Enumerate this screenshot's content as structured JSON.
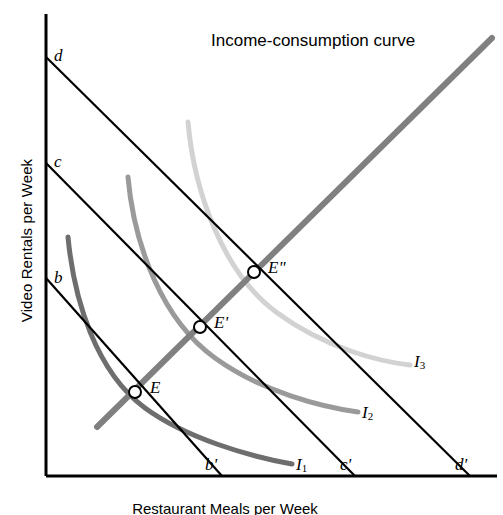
{
  "figure": {
    "title": "Income-consumption curve",
    "axis_y_label": "Video Rentals per Week",
    "axis_x_label": "Restaurant Meals per Week",
    "colors": {
      "axis": "#000000",
      "budget_line": "#000000",
      "icc": "#808080",
      "i1": "#6e6e6e",
      "i2": "#9a9a9a",
      "i3": "#d2d2d2",
      "marker_fill": "#ffffff"
    }
  },
  "axes": {
    "origin": {
      "x": 46,
      "y": 476
    },
    "y_top": {
      "x": 46,
      "y": 14
    },
    "x_right": {
      "x": 497,
      "y": 476
    }
  },
  "budget_lines": [
    {
      "name": "bb'",
      "y_label": "b",
      "x_label": "b'",
      "y_intercept": {
        "x": 46,
        "y": 278
      },
      "x_intercept": {
        "x": 222,
        "y": 476
      },
      "y_label_pos": {
        "x": 54,
        "y": 268
      },
      "x_label_pos": {
        "x": 205,
        "y": 455
      }
    },
    {
      "name": "cc'",
      "y_label": "c",
      "x_label": "c'",
      "y_intercept": {
        "x": 46,
        "y": 163
      },
      "x_intercept": {
        "x": 355,
        "y": 476
      },
      "y_label_pos": {
        "x": 54,
        "y": 152
      },
      "x_label_pos": {
        "x": 340,
        "y": 455
      }
    },
    {
      "name": "dd'",
      "y_label": "d",
      "x_label": "d'",
      "y_intercept": {
        "x": 46,
        "y": 57
      },
      "x_intercept": {
        "x": 470,
        "y": 476
      },
      "y_label_pos": {
        "x": 54,
        "y": 46
      },
      "x_label_pos": {
        "x": 455,
        "y": 455
      }
    }
  ],
  "indifference_curves": [
    {
      "label": "I",
      "subscript": "1",
      "color": "#6e6e6e",
      "label_pos": {
        "x": 296,
        "y": 455
      },
      "path": "M 68,237 C 74,300 96,372 145,408 C 186,438 248,456 292,464"
    },
    {
      "label": "I",
      "subscript": "2",
      "color": "#9a9a9a",
      "label_pos": {
        "x": 362,
        "y": 403
      },
      "path": "M 128,177 C 134,245 162,320 215,358 C 262,392 322,407 358,412"
    },
    {
      "label": "I",
      "subscript": "3",
      "color": "#d2d2d2",
      "label_pos": {
        "x": 414,
        "y": 352
      },
      "path": "M 188,122 C 194,190 222,272 276,312 C 326,349 382,362 410,365"
    }
  ],
  "income_consumption_curve": {
    "label": "Income-consumption curve",
    "color": "#808080",
    "start": {
      "x": 97,
      "y": 427
    },
    "end": {
      "x": 492,
      "y": 38
    }
  },
  "equilibrium_points": [
    {
      "label": "E",
      "x": 135,
      "y": 392,
      "label_pos": {
        "x": 150,
        "y": 378
      }
    },
    {
      "label": "E'",
      "x": 200,
      "y": 327,
      "label_pos": {
        "x": 214,
        "y": 313
      }
    },
    {
      "label": "E\"",
      "x": 254,
      "y": 272,
      "label_pos": {
        "x": 268,
        "y": 258
      }
    }
  ]
}
